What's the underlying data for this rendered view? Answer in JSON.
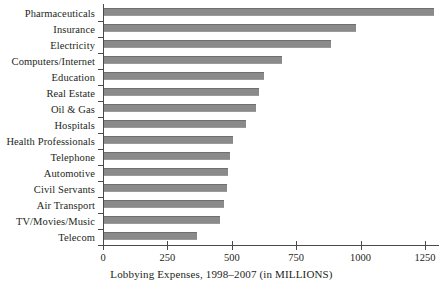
{
  "chart_data": {
    "type": "bar",
    "orientation": "horizontal",
    "title": "",
    "xlabel": "Lobbying Expenses, 1998–2007 (in MILLIONS)",
    "ylabel": "",
    "xlim": [
      0,
      1250
    ],
    "xticks": [
      0,
      250,
      500,
      750,
      1000,
      1250
    ],
    "xtick_labels": [
      "0",
      "250",
      "500",
      "750",
      "1000",
      "1250"
    ],
    "grid": false,
    "legend": null,
    "bar_color": "#8a8a8a",
    "axis_color": "#4a4a4a",
    "categories": [
      "Pharmaceuticals",
      "Insurance",
      "Electricity",
      "Computers/Internet",
      "Education",
      "Real Estate",
      "Oil & Gas",
      "Hospitals",
      "Health Professionals",
      "Telephone",
      "Automotive",
      "Civil Servants",
      "Air Transport",
      "TV/Movies/Music",
      "Telecom"
    ],
    "values": [
      1280,
      980,
      880,
      690,
      620,
      600,
      590,
      550,
      500,
      490,
      480,
      478,
      466,
      450,
      360
    ]
  },
  "caption": {
    "text": "Lobbying Expenses, 1998–2007 (in MILLIONS)"
  }
}
